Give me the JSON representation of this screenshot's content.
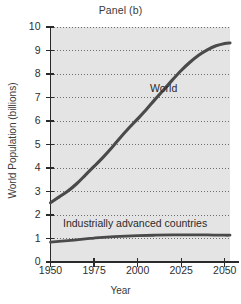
{
  "chart_data": {
    "type": "line",
    "title": "Panel (b)",
    "xlabel": "Year",
    "ylabel": "World Population (billions)",
    "xlim": [
      1950,
      2053
    ],
    "ylim": [
      0,
      10
    ],
    "xticks": [
      1950,
      1975,
      2000,
      2025,
      2050
    ],
    "xtick_labels": [
      "1950",
      "1975",
      "2000",
      "2025",
      "2050"
    ],
    "yticks": [
      0,
      1,
      2,
      3,
      4,
      5,
      6,
      7,
      8,
      9,
      10
    ],
    "ytick_labels": [
      "0",
      "1",
      "2",
      "3",
      "4",
      "5",
      "6",
      "7",
      "8",
      "9",
      "10"
    ],
    "grid": "horizontal-dotted",
    "legend": "inline-annotations",
    "plot_background": "#e4e4e4",
    "line_color": "#4a4a4a",
    "series": [
      {
        "name": "World",
        "label": "World",
        "x": [
          1950,
          1955,
          1960,
          1965,
          1970,
          1975,
          1980,
          1985,
          1990,
          1995,
          2000,
          2005,
          2010,
          2015,
          2020,
          2025,
          2030,
          2035,
          2040,
          2045,
          2050,
          2053
        ],
        "values": [
          2.52,
          2.77,
          3.02,
          3.33,
          3.7,
          4.07,
          4.44,
          4.85,
          5.29,
          5.7,
          6.09,
          6.49,
          6.92,
          7.33,
          7.75,
          8.15,
          8.5,
          8.8,
          9.03,
          9.2,
          9.3,
          9.32
        ]
      },
      {
        "name": "Industrially advanced countries",
        "label": "Industrially advanced countries",
        "x": [
          1950,
          1960,
          1970,
          1975,
          1980,
          1990,
          2000,
          2010,
          2020,
          2030,
          2040,
          2050,
          2053
        ],
        "values": [
          0.85,
          0.91,
          0.98,
          1.02,
          1.05,
          1.09,
          1.12,
          1.14,
          1.15,
          1.15,
          1.15,
          1.14,
          1.14
        ]
      }
    ]
  }
}
